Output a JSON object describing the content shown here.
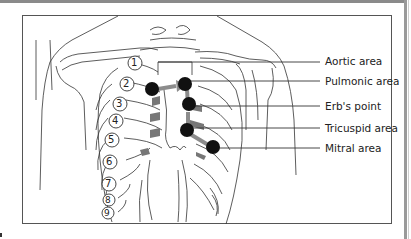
{
  "figure": {
    "type": "anatomical-diagram",
    "labels": [
      {
        "id": "aortic",
        "text": "Aortic area",
        "y": 61
      },
      {
        "id": "pulmonic",
        "text": "Pulmonic area",
        "y": 81
      },
      {
        "id": "erbs",
        "text": "Erb's point",
        "y": 106
      },
      {
        "id": "tricuspid",
        "text": "Tricuspid area",
        "y": 128
      },
      {
        "id": "mitral",
        "text": "Mitral area",
        "y": 148
      }
    ],
    "rib_numbers": [
      "1",
      "2",
      "3",
      "4",
      "5",
      "6",
      "7",
      "8",
      "9"
    ],
    "colors": {
      "marker": "#111111",
      "arrow": "#8c8c8c",
      "line": "#333333",
      "frame": "#555555"
    }
  }
}
